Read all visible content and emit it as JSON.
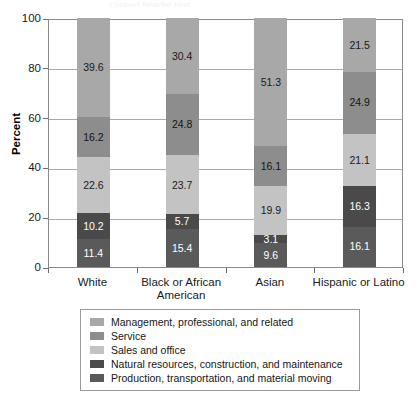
{
  "top_artifact": "clipped header text",
  "chart_data": {
    "type": "bar",
    "subtype": "stacked-bar-100-percent",
    "title": "",
    "xlabel": "",
    "ylabel": "Percent",
    "ylim": [
      0,
      100
    ],
    "yticks": [
      0,
      20,
      40,
      60,
      80,
      100
    ],
    "ytick_labels": [
      "0",
      "20",
      "40",
      "60",
      "80",
      "100"
    ],
    "grid": true,
    "legend_position": "bottom",
    "categories": [
      "White",
      "Black or African American",
      "Asian",
      "Hispanic or Latino"
    ],
    "series": [
      {
        "name": "Management, professional, and related",
        "color": "#a8a8a8",
        "label_color": "#1a1a1a",
        "values": [
          39.6,
          30.4,
          51.3,
          21.5
        ]
      },
      {
        "name": "Service",
        "color": "#8d8d8d",
        "label_color": "#141414",
        "values": [
          16.2,
          24.8,
          16.1,
          24.9
        ]
      },
      {
        "name": "Sales and office",
        "color": "#c3c3c3",
        "label_color": "#1a1a1a",
        "values": [
          22.6,
          23.7,
          19.9,
          21.1
        ]
      },
      {
        "name": "Natural resources, construction, and maintenance",
        "color": "#4a4a4a",
        "label_color": "#ffffff",
        "values": [
          10.2,
          5.7,
          3.1,
          16.3
        ]
      },
      {
        "name": "Production, transportation, and material moving",
        "color": "#5a5a5a",
        "label_color": "#ffffff",
        "values": [
          11.4,
          15.4,
          9.6,
          16.1
        ]
      }
    ]
  },
  "axis": {
    "y_title": "Percent",
    "y_tick_labels": [
      "100",
      "80",
      "60",
      "40",
      "20",
      "0"
    ],
    "x_categories": [
      {
        "line1": "White",
        "line2": ""
      },
      {
        "line1": "Black or African",
        "line2": "American"
      },
      {
        "line1": "Asian",
        "line2": ""
      },
      {
        "line1": "Hispanic or Latino",
        "line2": ""
      }
    ]
  },
  "legend": {
    "items": [
      {
        "label": "Management, professional, and related",
        "color": "#a8a8a8"
      },
      {
        "label": "Service",
        "color": "#8d8d8d"
      },
      {
        "label": "Sales and office",
        "color": "#c3c3c3"
      },
      {
        "label": "Natural resources, construction, and maintenance",
        "color": "#4a4a4a"
      },
      {
        "label": "Production, transportation, and material moving",
        "color": "#5a5a5a"
      }
    ]
  },
  "bar_labels": {
    "white": [
      "39.6",
      "16.2",
      "22.6",
      "10.2",
      "11.4"
    ],
    "black": [
      "30.4",
      "24.8",
      "23.7",
      "5.7",
      "15.4"
    ],
    "asian": [
      "51.3",
      "16.1",
      "19.9",
      "3.1",
      "9.6"
    ],
    "hispanic": [
      "21.5",
      "24.9",
      "21.1",
      "16.3",
      "16.1"
    ]
  }
}
